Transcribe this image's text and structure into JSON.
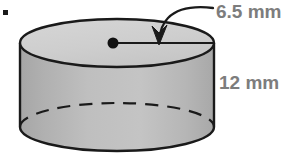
{
  "figure": {
    "name": "cylinder-diagram",
    "shape": "cylinder",
    "background_color": "#ffffff",
    "outline_color": "#1a1a1a",
    "top_face_color": "#cfcfcf",
    "body_color": "#bdbdbd",
    "body_shade_left_color": "#a9a9a9",
    "label_color": "#7d7d7d"
  },
  "labels": {
    "radius": "6.5 mm",
    "height": "12 mm"
  },
  "annotations": {
    "radius_line_name": "radius-segment",
    "center_point_name": "center-point",
    "leader_name": "radius-leader-arrow",
    "hidden_edge_name": "hidden-base-edge-dashed"
  },
  "geometry": {
    "top_ellipse_cx": 117,
    "top_ellipse_cy": 43,
    "top_ellipse_rx": 97,
    "top_ellipse_ry": 24,
    "bottom_ellipse_cy": 127,
    "cylinder_height_px": 84,
    "center_dot_x": 113,
    "center_dot_y": 43,
    "radius_end_x": 214
  },
  "artifact": {
    "name": "bullet-dot",
    "x": 3,
    "y": 10,
    "size": 5,
    "color": "#1a1a1a"
  },
  "measurements": {
    "radius_value": 6.5,
    "radius_unit": "mm",
    "height_value": 12,
    "height_unit": "mm"
  }
}
